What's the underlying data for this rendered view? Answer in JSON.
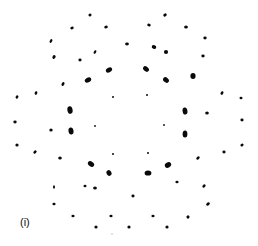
{
  "figure": {
    "panel_label": "(i)",
    "label_position": [
      20,
      216
    ],
    "spot_color": "#0a0a0a",
    "spots": [
      {
        "x": 90,
        "y": 15,
        "rx": 1.6,
        "ry": 1.4,
        "rot": -30
      },
      {
        "x": 165,
        "y": 15,
        "rx": 1.8,
        "ry": 1.5,
        "rot": -30
      },
      {
        "x": 106,
        "y": 27,
        "rx": 1.8,
        "ry": 1.4,
        "rot": -20
      },
      {
        "x": 149,
        "y": 25,
        "rx": 1.8,
        "ry": 1.4,
        "rot": 20
      },
      {
        "x": 72,
        "y": 28,
        "rx": 1.8,
        "ry": 1.3,
        "rot": -20
      },
      {
        "x": 186,
        "y": 27,
        "rx": 1.9,
        "ry": 1.5,
        "rot": 0
      },
      {
        "x": 205,
        "y": 38,
        "rx": 1.7,
        "ry": 1.4,
        "rot": 0
      },
      {
        "x": 51,
        "y": 41,
        "rx": 2.0,
        "ry": 1.2,
        "rot": -60
      },
      {
        "x": 127,
        "y": 44,
        "rx": 1.9,
        "ry": 1.4,
        "rot": 0
      },
      {
        "x": 154,
        "y": 47,
        "rx": 2.3,
        "ry": 1.9,
        "rot": 20
      },
      {
        "x": 166,
        "y": 52,
        "rx": 2.1,
        "ry": 1.9,
        "rot": 0
      },
      {
        "x": 95,
        "y": 52,
        "rx": 1.9,
        "ry": 1.2,
        "rot": -60
      },
      {
        "x": 54,
        "y": 57,
        "rx": 1.9,
        "ry": 1.5,
        "rot": -60
      },
      {
        "x": 203,
        "y": 56,
        "rx": 1.7,
        "ry": 1.4,
        "rot": 0
      },
      {
        "x": 80,
        "y": 60,
        "rx": 1.6,
        "ry": 1.4,
        "rot": 0
      },
      {
        "x": 109,
        "y": 70,
        "rx": 3.3,
        "ry": 2.3,
        "rot": -30
      },
      {
        "x": 146,
        "y": 69,
        "rx": 3.3,
        "ry": 2.3,
        "rot": 40
      },
      {
        "x": 193,
        "y": 76,
        "rx": 2.6,
        "ry": 3.0,
        "rot": 0
      },
      {
        "x": 88,
        "y": 80,
        "rx": 3.4,
        "ry": 2.4,
        "rot": -30
      },
      {
        "x": 166,
        "y": 80,
        "rx": 3.2,
        "ry": 2.4,
        "rot": 40
      },
      {
        "x": 63,
        "y": 84,
        "rx": 2.1,
        "ry": 1.3,
        "rot": -60
      },
      {
        "x": 36,
        "y": 93,
        "rx": 1.8,
        "ry": 1.3,
        "rot": -70
      },
      {
        "x": 17,
        "y": 97,
        "rx": 1.7,
        "ry": 1.3,
        "rot": -60
      },
      {
        "x": 222,
        "y": 93,
        "rx": 1.9,
        "ry": 1.3,
        "rot": -60
      },
      {
        "x": 241,
        "y": 98,
        "rx": 1.5,
        "ry": 1.3,
        "rot": 0
      },
      {
        "x": 113,
        "y": 97,
        "rx": 1.0,
        "ry": 1.0,
        "rot": 0
      },
      {
        "x": 147,
        "y": 95,
        "rx": 1.0,
        "ry": 1.0,
        "rot": 0
      },
      {
        "x": 70,
        "y": 110,
        "rx": 2.6,
        "ry": 3.8,
        "rot": -10
      },
      {
        "x": 185,
        "y": 111,
        "rx": 2.4,
        "ry": 3.6,
        "rot": -10
      },
      {
        "x": 207,
        "y": 113,
        "rx": 1.8,
        "ry": 1.5,
        "rot": 0
      },
      {
        "x": 15,
        "y": 122,
        "rx": 1.7,
        "ry": 1.4,
        "rot": 0
      },
      {
        "x": 242,
        "y": 120,
        "rx": 1.6,
        "ry": 1.4,
        "rot": 0
      },
      {
        "x": 95,
        "y": 126,
        "rx": 0.9,
        "ry": 0.9,
        "rot": 0
      },
      {
        "x": 164,
        "y": 125,
        "rx": 0.9,
        "ry": 0.9,
        "rot": 0
      },
      {
        "x": 51,
        "y": 130,
        "rx": 1.7,
        "ry": 1.5,
        "rot": 0
      },
      {
        "x": 71,
        "y": 131,
        "rx": 2.5,
        "ry": 3.5,
        "rot": -10
      },
      {
        "x": 185,
        "y": 134,
        "rx": 2.4,
        "ry": 3.5,
        "rot": 0
      },
      {
        "x": 17,
        "y": 145,
        "rx": 1.6,
        "ry": 1.5,
        "rot": 0
      },
      {
        "x": 242,
        "y": 145,
        "rx": 1.7,
        "ry": 1.4,
        "rot": -40
      },
      {
        "x": 35,
        "y": 152,
        "rx": 1.8,
        "ry": 1.4,
        "rot": -40
      },
      {
        "x": 224,
        "y": 152,
        "rx": 1.6,
        "ry": 1.4,
        "rot": 0
      },
      {
        "x": 113,
        "y": 154,
        "rx": 1.0,
        "ry": 1.0,
        "rot": 0
      },
      {
        "x": 148,
        "y": 153,
        "rx": 1.0,
        "ry": 1.0,
        "rot": 0
      },
      {
        "x": 60,
        "y": 158,
        "rx": 1.8,
        "ry": 1.6,
        "rot": 0
      },
      {
        "x": 198,
        "y": 158,
        "rx": 1.9,
        "ry": 1.4,
        "rot": -40
      },
      {
        "x": 91,
        "y": 164,
        "rx": 3.4,
        "ry": 2.4,
        "rot": 35
      },
      {
        "x": 168,
        "y": 165,
        "rx": 3.3,
        "ry": 2.6,
        "rot": -30
      },
      {
        "x": 109,
        "y": 173,
        "rx": 2.4,
        "ry": 2.9,
        "rot": -30
      },
      {
        "x": 148,
        "y": 173,
        "rx": 3.4,
        "ry": 2.6,
        "rot": 0
      },
      {
        "x": 177,
        "y": 182,
        "rx": 1.6,
        "ry": 1.3,
        "rot": 0
      },
      {
        "x": 54,
        "y": 187,
        "rx": 1.0,
        "ry": 1.8,
        "rot": 0
      },
      {
        "x": 85,
        "y": 186,
        "rx": 1.5,
        "ry": 1.3,
        "rot": 0
      },
      {
        "x": 204,
        "y": 186,
        "rx": 1.8,
        "ry": 1.4,
        "rot": -40
      },
      {
        "x": 95,
        "y": 188,
        "rx": 1.9,
        "ry": 1.6,
        "rot": 0
      },
      {
        "x": 133,
        "y": 196,
        "rx": 1.6,
        "ry": 1.4,
        "rot": 0
      },
      {
        "x": 54,
        "y": 204,
        "rx": 1.6,
        "ry": 1.3,
        "rot": 0
      },
      {
        "x": 208,
        "y": 204,
        "rx": 2.0,
        "ry": 1.5,
        "rot": -45
      },
      {
        "x": 73,
        "y": 216,
        "rx": 1.6,
        "ry": 1.3,
        "rot": 0
      },
      {
        "x": 111,
        "y": 216,
        "rx": 1.6,
        "ry": 1.3,
        "rot": 0
      },
      {
        "x": 153,
        "y": 216,
        "rx": 1.6,
        "ry": 1.3,
        "rot": 0
      },
      {
        "x": 188,
        "y": 217,
        "rx": 1.6,
        "ry": 1.5,
        "rot": -40
      },
      {
        "x": 96,
        "y": 227,
        "rx": 1.6,
        "ry": 1.5,
        "rot": 0
      },
      {
        "x": 129,
        "y": 227,
        "rx": 1.6,
        "ry": 1.5,
        "rot": 0
      },
      {
        "x": 167,
        "y": 227,
        "rx": 1.6,
        "ry": 1.5,
        "rot": 0
      },
      {
        "x": 112,
        "y": 234,
        "rx": 0.8,
        "ry": 0.8,
        "rot": 0,
        "faint": true
      }
    ]
  }
}
